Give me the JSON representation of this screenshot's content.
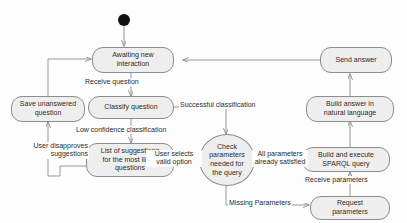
{
  "diagram": {
    "type": "uml-state-diagram",
    "background_color": "#fdfdfd",
    "node_fill_color": "#eeeeee",
    "node_border_color": "#8d8d8d",
    "edge_color": "#8d8d8d",
    "text_color": "#2b2b2b",
    "initial_node_color": "#111111"
  },
  "nodes": [
    {
      "id": "initial",
      "label": "",
      "shape": "filled-circle"
    },
    {
      "id": "awaiting",
      "label": "Awaiting new\ninteraction",
      "shape": "rounded-rect"
    },
    {
      "id": "send_answer",
      "label": "Send answer",
      "shape": "rounded-rect"
    },
    {
      "id": "save_unanswered",
      "label": "Save unanswered\nquestion",
      "shape": "rounded-rect"
    },
    {
      "id": "classify",
      "label": "Classify question",
      "shape": "rounded-rect"
    },
    {
      "id": "build_answer",
      "label": "Build answer in\nnatural language",
      "shape": "rounded-rect"
    },
    {
      "id": "suggestions",
      "label": "List of suggestions\nfor the most likely\nquestions",
      "shape": "rounded-rect"
    },
    {
      "id": "check_params",
      "label": "Check\nparameters\nneeded for\nthe query",
      "shape": "oval"
    },
    {
      "id": "build_sparql",
      "label": "Build and execute\nSPARQL query",
      "shape": "rounded-rect"
    },
    {
      "id": "request_params",
      "label": "Request\nparameters",
      "shape": "rounded-rect"
    }
  ],
  "transitions": [
    {
      "id": "t_receive_question",
      "label": "Receive question",
      "from": "awaiting",
      "to": "classify"
    },
    {
      "id": "t_low_confidence",
      "label": "Low confidence classification",
      "from": "classify",
      "to": "suggestions"
    },
    {
      "id": "t_successful",
      "label": "Successful classification",
      "from": "classify",
      "to": "check_params"
    },
    {
      "id": "t_user_disapproves",
      "label": "User disapproves\nsuggestions",
      "from": "suggestions",
      "to": "save_unanswered"
    },
    {
      "id": "t_user_selects",
      "label": "User selects\nvalid option",
      "from": "suggestions",
      "to": "check_params"
    },
    {
      "id": "t_all_satisfied",
      "label": "All parameters\nalready satisfied",
      "from": "check_params",
      "to": "build_sparql"
    },
    {
      "id": "t_missing_params",
      "label": "Missing Parameters",
      "from": "check_params",
      "to": "request_params"
    },
    {
      "id": "t_receive_params",
      "label": "Receive parameters",
      "from": "request_params",
      "to": "build_sparql"
    },
    {
      "id": "t_build_answer",
      "label": "",
      "from": "build_sparql",
      "to": "build_answer"
    },
    {
      "id": "t_send_answer",
      "label": "",
      "from": "build_answer",
      "to": "send_answer"
    },
    {
      "id": "t_return_awaiting",
      "label": "",
      "from": "send_answer",
      "to": "awaiting"
    },
    {
      "id": "t_save_return",
      "label": "",
      "from": "save_unanswered",
      "to": "awaiting"
    },
    {
      "id": "t_start",
      "label": "",
      "from": "initial",
      "to": "awaiting"
    }
  ]
}
